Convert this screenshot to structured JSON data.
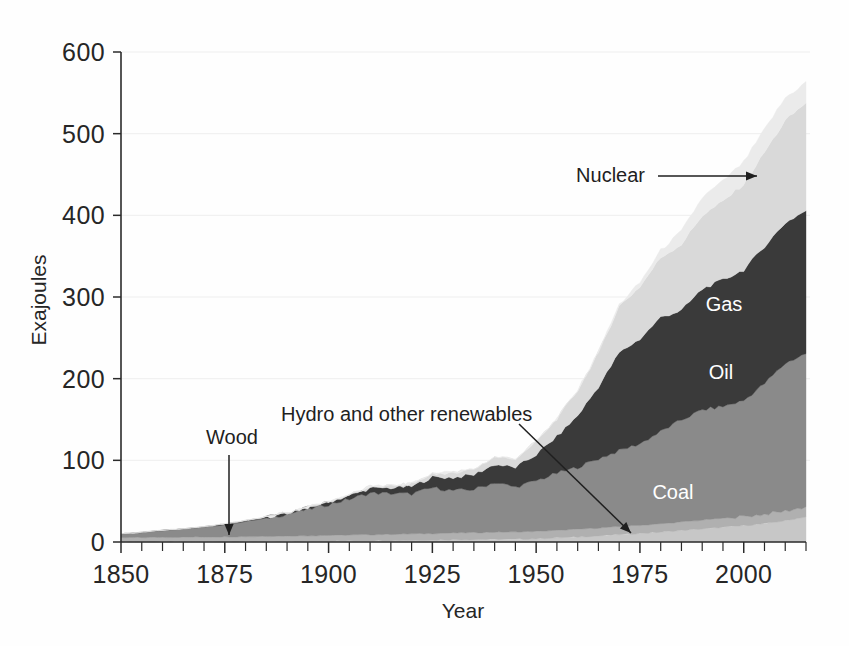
{
  "figure": {
    "background_color": "#fefefe",
    "plot_left_px": 121,
    "plot_right_px": 806,
    "plot_top_px": 52,
    "plot_bottom_px": 542
  },
  "axes": {
    "y": {
      "title": "Exajoules",
      "ticks": [
        "0",
        "100",
        "200",
        "300",
        "400",
        "500",
        "600"
      ],
      "min": 0,
      "max": 600
    },
    "x": {
      "title": "Year",
      "ticks": [
        "1850",
        "1875",
        "1900",
        "1925",
        "1950",
        "1975",
        "2000"
      ],
      "min": 1850,
      "max": 2015,
      "minor_tick_interval": 5
    }
  },
  "series_labels": [
    {
      "name": "Gas",
      "text": "Gas",
      "x_px": 724,
      "y_px": 311,
      "style": "light"
    },
    {
      "name": "Oil",
      "text": "Oil",
      "x_px": 721,
      "y_px": 379,
      "style": "light"
    },
    {
      "name": "Coal",
      "text": "Coal",
      "x_px": 673,
      "y_px": 499,
      "style": "light"
    }
  ],
  "annotations": [
    {
      "name": "nuclear",
      "text": "Nuclear",
      "text_x_px": 645,
      "text_y_px": 182,
      "anchor": "end",
      "arrow": {
        "x1": 658,
        "y1": 176,
        "x2": 757,
        "y2": 176
      }
    },
    {
      "name": "wood",
      "text": "Wood",
      "text_x_px": 232,
      "text_y_px": 444,
      "anchor": "middle",
      "arrow": {
        "x1": 229,
        "y1": 455,
        "x2": 229,
        "y2": 535
      }
    },
    {
      "name": "hydro-and-other-renewables",
      "text": "Hydro and other renewables",
      "text_x_px": 281,
      "text_y_px": 421,
      "anchor": "start",
      "arrow": {
        "x1": 519,
        "y1": 424,
        "x2": 631,
        "y2": 533
      }
    }
  ],
  "colors": {
    "hydro": "#c7c7c7",
    "wood": "#b0b0b0",
    "coal": "#8a8a8a",
    "oil": "#3a3a3a",
    "gas": "#d9d9d9",
    "nuclear": "#ebebeb",
    "axis": "#2b2b2b",
    "grid": "#d8d8d8",
    "label_light": "#ffffff",
    "label_dark": "#1f1f1f"
  },
  "chart_data": {
    "type": "area",
    "stacked": true,
    "title": "",
    "xlabel": "Year",
    "ylabel": "Exajoules",
    "xlim": [
      1850,
      2015
    ],
    "ylim": [
      0,
      600
    ],
    "grid": true,
    "legend": "inline-annotations",
    "x": [
      1850,
      1855,
      1860,
      1865,
      1870,
      1875,
      1880,
      1885,
      1890,
      1895,
      1900,
      1905,
      1910,
      1915,
      1920,
      1925,
      1930,
      1935,
      1940,
      1945,
      1950,
      1955,
      1960,
      1965,
      1970,
      1975,
      1980,
      1985,
      1990,
      1995,
      2000,
      2005,
      2010,
      2015
    ],
    "series": [
      {
        "name": "Hydro and other renewables",
        "color": "#c7c7c7",
        "values": [
          0.2,
          0.2,
          0.3,
          0.3,
          0.4,
          0.4,
          0.5,
          0.6,
          0.7,
          0.9,
          1.1,
          1.3,
          1.6,
          1.8,
          2.1,
          2.4,
          2.8,
          3.0,
          3.4,
          3.4,
          4.0,
          5.0,
          6.2,
          7.5,
          9.0,
          10.5,
          12.0,
          14.0,
          16.0,
          18.0,
          20.0,
          22.5,
          26.0,
          31.0
        ]
      },
      {
        "name": "Wood",
        "color": "#b0b0b0",
        "values": [
          5.0,
          5.2,
          5.4,
          5.6,
          5.8,
          6.0,
          6.2,
          6.4,
          6.6,
          6.8,
          7.0,
          7.2,
          7.4,
          7.6,
          7.8,
          8.0,
          8.2,
          8.4,
          8.6,
          8.8,
          9.0,
          9.2,
          9.4,
          9.6,
          9.8,
          10.0,
          10.2,
          10.5,
          10.8,
          11.0,
          11.2,
          11.5,
          11.8,
          12.0
        ]
      },
      {
        "name": "Coal",
        "color": "#8a8a8a",
        "values": [
          5.0,
          6.5,
          8.5,
          10.0,
          12.0,
          15.0,
          18.5,
          22.0,
          27.0,
          32.0,
          38.0,
          44.0,
          51.0,
          50.0,
          49.0,
          56.0,
          52.0,
          53.0,
          61.0,
          55.0,
          62.0,
          70.0,
          76.0,
          85.0,
          93.0,
          100.0,
          113.0,
          125.0,
          135.0,
          137.0,
          142.0,
          160.0,
          181.0,
          188.0
        ]
      },
      {
        "name": "Oil",
        "color": "#3a3a3a",
        "values": [
          0.0,
          0.1,
          0.2,
          0.3,
          0.4,
          0.6,
          0.9,
          1.2,
          1.6,
          2.2,
          3.0,
          4.2,
          5.8,
          7.0,
          9.0,
          13.0,
          16.0,
          18.0,
          22.0,
          24.0,
          32.0,
          45.0,
          63.0,
          88.0,
          120.0,
          128.0,
          140.0,
          134.0,
          148.0,
          155.0,
          160.0,
          168.0,
          172.0,
          175.0
        ]
      },
      {
        "name": "Gas",
        "color": "#d9d9d9",
        "values": [
          0.0,
          0.0,
          0.0,
          0.1,
          0.1,
          0.2,
          0.2,
          0.3,
          0.4,
          0.6,
          0.8,
          1.2,
          1.8,
          2.4,
          3.2,
          4.5,
          6.0,
          7.0,
          9.0,
          11.0,
          16.0,
          22.0,
          31.0,
          42.0,
          57.0,
          64.0,
          73.0,
          81.0,
          90.0,
          96.0,
          105.0,
          115.0,
          125.0,
          132.0
        ]
      },
      {
        "name": "Nuclear",
        "color": "#ebebeb",
        "values": [
          0.0,
          0.0,
          0.0,
          0.0,
          0.0,
          0.0,
          0.0,
          0.0,
          0.0,
          0.0,
          0.0,
          0.0,
          0.0,
          0.0,
          0.0,
          0.0,
          0.0,
          0.0,
          0.0,
          0.0,
          0.0,
          0.1,
          0.3,
          0.8,
          2.0,
          5.0,
          9.0,
          16.0,
          22.0,
          25.0,
          27.0,
          28.0,
          28.0,
          25.0
        ]
      }
    ]
  }
}
